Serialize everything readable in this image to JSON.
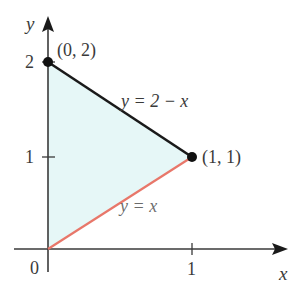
{
  "diagram": {
    "type": "region-plot",
    "axes": {
      "x_label": "x",
      "y_label": "y",
      "origin_label": "0",
      "x_ticks": [
        {
          "value": 1,
          "label": "1"
        }
      ],
      "y_ticks": [
        {
          "value": 1,
          "label": "1"
        },
        {
          "value": 2,
          "label": "2"
        }
      ]
    },
    "region": {
      "vertices": [
        [
          0,
          0
        ],
        [
          1,
          1
        ],
        [
          0,
          2
        ]
      ],
      "fill_color": "#e6f7f7"
    },
    "curves": [
      {
        "equation": "y = 2 − x",
        "label": "y = 2 − x",
        "from": [
          0,
          2
        ],
        "to": [
          1,
          1
        ],
        "color": "#1a1a1a"
      },
      {
        "equation": "y = x",
        "label": "y = x",
        "from": [
          0,
          0
        ],
        "to": [
          1,
          1
        ],
        "color": "#e8776a"
      }
    ],
    "points": [
      {
        "coords": [
          0,
          2
        ],
        "label": "(0, 2)"
      },
      {
        "coords": [
          1,
          1
        ],
        "label": "(1, 1)"
      }
    ],
    "colors": {
      "axis": "#3a3a3a",
      "upper_boundary": "#1a1a1a",
      "lower_boundary": "#e8776a",
      "region_fill": "#e6f7f7"
    }
  }
}
